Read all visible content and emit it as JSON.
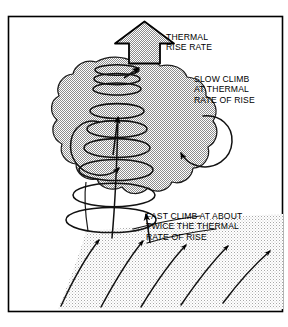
{
  "caption": {
    "text": "Practice your takeoffs"
  },
  "figure": {
    "frame_color": "#000000",
    "background_color": "#ffffff",
    "halftone_color": "#9a9a9a",
    "ink_color": "#000000"
  },
  "labels": {
    "thermal_rise_rate": "THERMAL\nRISE RATE",
    "slow_climb": "SLOW CLIMB\nAT THERMAL\nRATE OF RISE",
    "fast_climb": "FAST CLIMB AT ABOUT\nTWICE THE THERMAL\nRATE OF RISE"
  },
  "elements": {
    "up_arrow_name": "thermal-rise-arrow",
    "bubble_name": "thermal-bubble",
    "helix_name": "glider-climb-helix",
    "inflow_name": "thermal-inflow",
    "circulation_left": "counterclockwise",
    "circulation_right": "clockwise"
  }
}
